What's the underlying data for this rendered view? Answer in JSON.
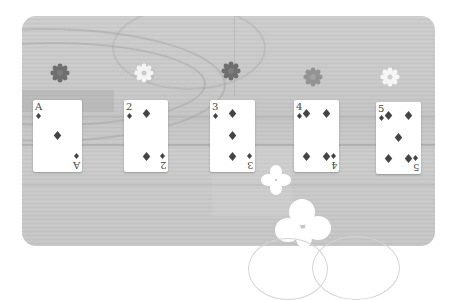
{
  "game": {
    "colors": {
      "table": "#c8c8c8",
      "card_face": "#ffffff",
      "suit_pip": "#444444",
      "chip_dark": "#6f6f6f",
      "chip_light": "#f2f2f2",
      "chip_mid": "#8f8f8f",
      "clover": "#ffffff"
    },
    "chips": [
      {
        "label": "chip-1",
        "tone": "dark"
      },
      {
        "label": "chip-2",
        "tone": "light"
      },
      {
        "label": "chip-3",
        "tone": "dark"
      },
      {
        "label": "chip-4",
        "tone": "mid"
      },
      {
        "label": "chip-5",
        "tone": "light"
      }
    ],
    "cards": [
      {
        "rank": "A",
        "suit": "diamonds",
        "suit_icon": "♦"
      },
      {
        "rank": "2",
        "suit": "diamonds",
        "suit_icon": "♦"
      },
      {
        "rank": "3",
        "suit": "diamonds",
        "suit_icon": "♦"
      },
      {
        "rank": "4",
        "suit": "diamonds",
        "suit_icon": "♦"
      },
      {
        "rank": "5",
        "suit": "diamonds",
        "suit_icon": "♦"
      }
    ]
  }
}
